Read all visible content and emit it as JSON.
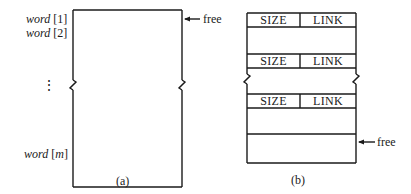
{
  "figure_a": {
    "caption": "(a)",
    "rows": [
      {
        "name": "word",
        "index": "1"
      },
      {
        "name": "word",
        "index": "2"
      },
      {
        "name": "word",
        "index": "m"
      }
    ],
    "ellipsis": "⋮",
    "pointer_label": "free"
  },
  "figure_b": {
    "caption": "(b)",
    "blocks": [
      {
        "size_label": "SIZE",
        "link_label": "LINK"
      },
      {
        "size_label": "SIZE",
        "link_label": "LINK"
      },
      {
        "size_label": "SIZE",
        "link_label": "LINK"
      }
    ],
    "pointer_label": "free"
  },
  "colors": {
    "line": "#1a1a1a",
    "background": "#ffffff"
  }
}
